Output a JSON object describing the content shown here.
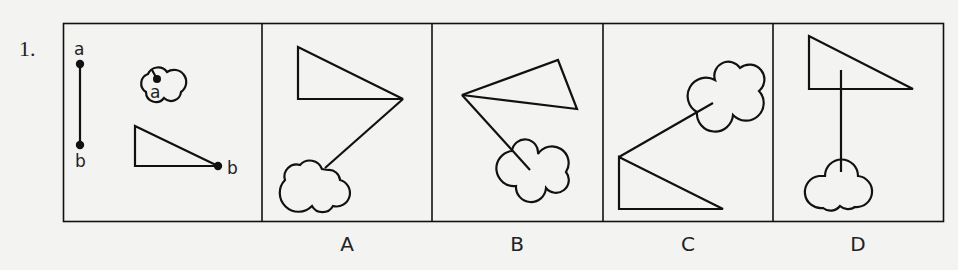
{
  "question": {
    "number": "1.",
    "reference_labels": {
      "segment_top": "a",
      "segment_bottom": "b",
      "cloud_point": "a",
      "triangle_point": "b"
    },
    "options": [
      {
        "label": "A"
      },
      {
        "label": "B"
      },
      {
        "label": "C"
      },
      {
        "label": "D"
      }
    ]
  },
  "colors": {
    "background": "#f3f3f1",
    "stroke": "#111111"
  }
}
